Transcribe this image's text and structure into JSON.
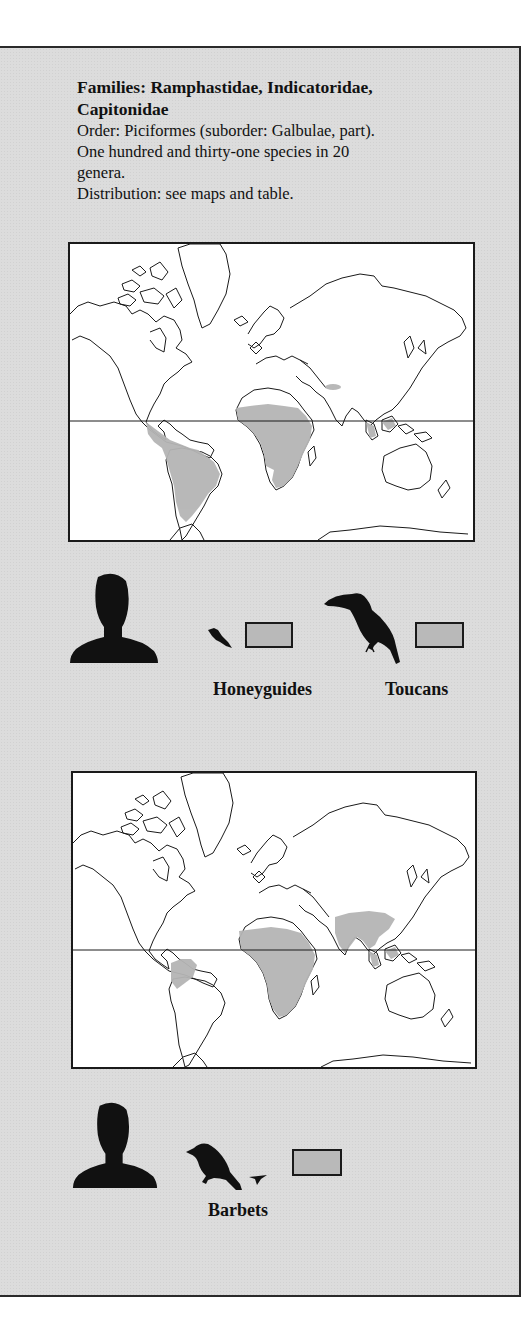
{
  "header": {
    "title_line1": "Families: Ramphastidae, Indicatoridae,",
    "title_line2": "Capitonidae",
    "order": "Order: Piciformes (suborder: Galbulae, part).",
    "species_line1": "One hundred and thirty-one species in 20",
    "species_line2": "genera.",
    "distribution": "Distribution: see maps and table."
  },
  "maps": [
    {
      "name": "honeyguides-toucans-map",
      "shaded_regions": [
        "Central America",
        "northern South America",
        "sub-Saharan Africa",
        "Himalayan foothills",
        "Borneo/Sumatra"
      ],
      "equator": true
    },
    {
      "name": "barbets-map",
      "shaded_regions": [
        "northwestern South America",
        "sub-Saharan Africa",
        "Indian subcontinent and Southeast Asia",
        "Borneo/Sumatra"
      ],
      "equator": true
    }
  ],
  "legend_top": {
    "items": [
      {
        "icon": "honeyguide-bird-icon",
        "label": "Honeyguides",
        "swatch_color": "#b9b9b9"
      },
      {
        "icon": "toucan-bird-icon",
        "label": "Toucans",
        "swatch_color": "#b9b9b9"
      }
    ],
    "scale_icon": "human-silhouette-icon"
  },
  "legend_bottom": {
    "items": [
      {
        "icon": "barbet-bird-icon",
        "label": "Barbets",
        "swatch_color": "#b9b9b9"
      }
    ],
    "scale_icon": "human-silhouette-icon"
  },
  "colors": {
    "panel_bg": "#dcdcdc",
    "shade": "#b5b5b5",
    "ink": "#111111"
  }
}
